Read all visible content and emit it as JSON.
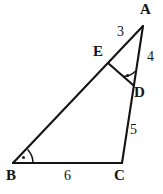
{
  "figure": {
    "type": "geometry-diagram",
    "background_color": "#ffffff",
    "stroke_color": "#141414",
    "vertices": [
      {
        "id": "A",
        "label": "A",
        "x": 143,
        "y": 26
      },
      {
        "id": "B",
        "label": "B",
        "x": 13,
        "y": 163
      },
      {
        "id": "C",
        "label": "C",
        "x": 122,
        "y": 163
      },
      {
        "id": "D",
        "label": "D",
        "x": 133,
        "y": 85
      },
      {
        "id": "E",
        "label": "E",
        "x": 108,
        "y": 63
      }
    ],
    "segments": [
      {
        "name": "segment-BA",
        "from": "B",
        "to": "A"
      },
      {
        "name": "segment-BC",
        "from": "B",
        "to": "C"
      },
      {
        "name": "segment-AC",
        "from": "A",
        "to": "C"
      },
      {
        "name": "segment-ED",
        "from": "E",
        "to": "D"
      }
    ],
    "length_labels": [
      {
        "name": "length-AE",
        "segment": "A-E",
        "value": "3"
      },
      {
        "name": "length-AD",
        "segment": "A-D",
        "value": "4"
      },
      {
        "name": "length-DC",
        "segment": "D-C",
        "value": "5"
      },
      {
        "name": "length-BC",
        "segment": "B-C",
        "value": "6"
      }
    ],
    "angle_marks": [
      {
        "name": "angle-mark-B",
        "at": "B",
        "style": "arc-with-dot"
      },
      {
        "name": "angle-mark-D",
        "at": "D",
        "style": "arc-with-dot"
      }
    ]
  }
}
